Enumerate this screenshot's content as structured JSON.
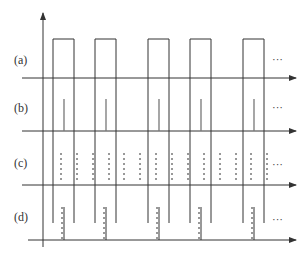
{
  "diagram": {
    "type": "timing-diagram",
    "rows": [
      {
        "id": "a",
        "label": "(a)",
        "label_pos": [
          14,
          54
        ],
        "axis_y": 78,
        "ellipsis": "···",
        "ellipsis_pos": [
          270,
          54
        ],
        "pulses": [
          [
            53,
            74
          ],
          [
            95,
            116
          ],
          [
            148,
            169
          ],
          [
            190,
            211
          ],
          [
            243,
            264
          ]
        ],
        "pulse_top": 39
      },
      {
        "id": "b",
        "label": "(b)",
        "label_pos": [
          14,
          102
        ],
        "axis_y": 131,
        "ellipsis": "···",
        "ellipsis_pos": [
          270,
          102
        ],
        "spikes_x": [
          64,
          106,
          159,
          201,
          254
        ],
        "spike_top": 99
      },
      {
        "id": "c",
        "label": "(c)",
        "label_pos": [
          14,
          157
        ],
        "axis_y": 185,
        "ellipsis": "···",
        "ellipsis_pos": [
          270,
          159
        ],
        "dashed_x": [
          61,
          77,
          93,
          109,
          124,
          140,
          156,
          172,
          188,
          204,
          220,
          236,
          251,
          267
        ],
        "dash_top": 153,
        "dash_bottom": 181
      },
      {
        "id": "d",
        "label": "(d)",
        "label_pos": [
          14,
          211
        ],
        "axis_y": 240,
        "ellipsis": "···",
        "ellipsis_pos": [
          270,
          214
        ],
        "markers_x": [
          63,
          105,
          158,
          200,
          253
        ],
        "marker_top": 207
      }
    ],
    "pulse_edges_x": [
      53,
      74,
      95,
      116,
      148,
      169,
      190,
      211,
      243,
      264
    ],
    "pulse_edges_bottom": 223,
    "y_axis": {
      "x": 43,
      "top": 13,
      "bottom": 247
    },
    "line_color": "#333333"
  }
}
